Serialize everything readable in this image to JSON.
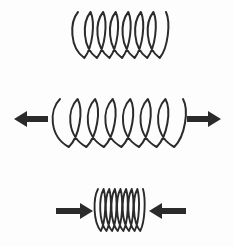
{
  "figure": {
    "description": "Three coil springs shown vertically: a relaxed spring at rest, a spring being stretched by outward arrows, and a spring being compressed by inward arrows.",
    "background_color": "#fdfdfd",
    "ink_color": "#2b2b2b",
    "canvas": {
      "width": 234,
      "height": 246
    }
  },
  "springs": [
    {
      "id": "spring-relaxed",
      "state_label": "relaxed",
      "coil_count": 7,
      "x_start": 78,
      "x_end": 166,
      "y_top": 12,
      "y_bottom": 58,
      "coil_pitch": 12.6,
      "coil_width": 17,
      "stroke_width": 2.0,
      "arrows": []
    },
    {
      "id": "spring-stretched",
      "state_label": "stretched",
      "coil_count": 7,
      "x_start": 60,
      "x_end": 183,
      "y_top": 99,
      "y_bottom": 147,
      "coil_pitch": 17.6,
      "coil_width": 22,
      "stroke_width": 2.0,
      "arrows": [
        {
          "id": "arrow-stretch-left",
          "direction": "left",
          "tail_x": 48,
          "tip_x": 14,
          "y": 119,
          "shaft_thickness": 6,
          "head_length": 13,
          "head_half_height": 8
        },
        {
          "id": "arrow-stretch-right",
          "direction": "right",
          "tail_x": 187,
          "tip_x": 221,
          "y": 119,
          "shaft_thickness": 6,
          "head_length": 13,
          "head_half_height": 8
        }
      ]
    },
    {
      "id": "spring-compressed",
      "state_label": "compressed",
      "coil_count": 8,
      "x_start": 98,
      "x_end": 143,
      "y_top": 189,
      "y_bottom": 231,
      "coil_pitch": 5.6,
      "coil_width": 10,
      "stroke_width": 1.9,
      "arrows": [
        {
          "id": "arrow-compress-left",
          "direction": "right",
          "tail_x": 56,
          "tip_x": 93,
          "y": 211,
          "shaft_thickness": 6,
          "head_length": 13,
          "head_half_height": 8
        },
        {
          "id": "arrow-compress-right",
          "direction": "left",
          "tail_x": 186,
          "tip_x": 149,
          "y": 211,
          "shaft_thickness": 6,
          "head_length": 13,
          "head_half_height": 8
        }
      ]
    }
  ]
}
